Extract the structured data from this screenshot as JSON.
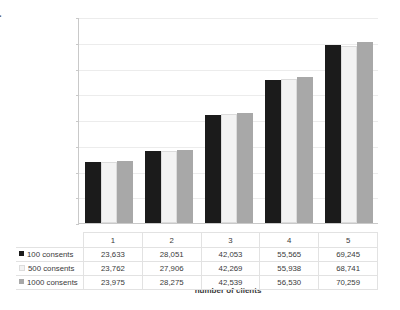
{
  "chart_data": {
    "type": "bar",
    "title": "",
    "xlabel": "number of clients",
    "ylabel": "response time in milliseconds",
    "categories": [
      "1",
      "2",
      "3",
      "4",
      "5"
    ],
    "ylim": [
      0,
      80
    ],
    "yticks": [
      0,
      10,
      20,
      30,
      40,
      50,
      60,
      70,
      80
    ],
    "grid": true,
    "legend_position": "table-left",
    "series": [
      {
        "name": "100 consents",
        "color": "#1b1b1b",
        "values": [
          23.633,
          28.051,
          42.053,
          55.565,
          69.245
        ],
        "labels": [
          "23,633",
          "28,051",
          "42,053",
          "55,565",
          "69,245"
        ]
      },
      {
        "name": "500 consents",
        "color": "#f3f3f3",
        "values": [
          23.762,
          27.906,
          42.269,
          55.938,
          68.741
        ],
        "labels": [
          "23,762",
          "27,906",
          "42,269",
          "55,938",
          "68,741"
        ]
      },
      {
        "name": "1000 consents",
        "color": "#a8a8a8",
        "values": [
          23.975,
          28.275,
          42.539,
          56.53,
          70.259
        ],
        "labels": [
          "23,975",
          "28,275",
          "42,539",
          "56,530",
          "70,259"
        ]
      }
    ]
  },
  "axis": {
    "y_labels": [
      "80",
      "70",
      "60",
      "50",
      "40",
      "30",
      "20",
      "10",
      "0"
    ],
    "y_title": "response time in milliseconds",
    "x_title": "number of clients"
  },
  "table": {
    "category_header": [
      "1",
      "2",
      "3",
      "4",
      "5"
    ],
    "rows": [
      {
        "legend": "100 consents",
        "values": [
          "23,633",
          "28,051",
          "42,053",
          "55,565",
          "69,245"
        ]
      },
      {
        "legend": "500 consents",
        "values": [
          "23,762",
          "27,906",
          "42,269",
          "55,938",
          "68,741"
        ]
      },
      {
        "legend": "1000 consents",
        "values": [
          "23,975",
          "28,275",
          "42,539",
          "56,530",
          "70,259"
        ]
      }
    ]
  },
  "colors": {
    "series_1": "#1b1b1b",
    "series_2": "#f3f3f3",
    "series_3": "#a8a8a8",
    "grid": "#ececec",
    "axis": "#c9c9c9"
  }
}
